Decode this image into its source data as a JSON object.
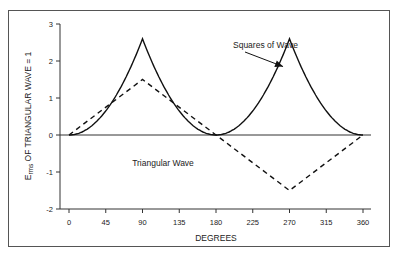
{
  "chart_data": {
    "type": "line",
    "title": "",
    "xlabel": "DEGREES",
    "ylabel_main": "E",
    "ylabel_sub": "rms",
    "ylabel_rest": " OF TRIANGULAR WAVE = 1",
    "xlim": [
      0,
      360
    ],
    "ylim": [
      -2,
      3
    ],
    "xticks": [
      0,
      45,
      90,
      135,
      180,
      225,
      270,
      315,
      360
    ],
    "yticks": [
      3,
      2,
      1,
      0,
      -1,
      -2
    ],
    "grid": false,
    "series": [
      {
        "name": "Squares of Wave",
        "style": "solid",
        "x": [
          0,
          15,
          30,
          45,
          60,
          75,
          90,
          105,
          120,
          135,
          150,
          165,
          180,
          195,
          210,
          225,
          240,
          255,
          270,
          285,
          300,
          315,
          330,
          345,
          360
        ],
        "y": [
          0,
          0.07,
          0.29,
          0.65,
          1.16,
          1.81,
          2.6,
          1.81,
          1.16,
          0.65,
          0.29,
          0.07,
          0,
          0.07,
          0.29,
          0.65,
          1.16,
          1.81,
          2.6,
          1.81,
          1.16,
          0.65,
          0.29,
          0.07,
          0
        ]
      },
      {
        "name": "Triangular Wave",
        "style": "dashed",
        "x": [
          0,
          90,
          180,
          270,
          360
        ],
        "y": [
          0,
          1.5,
          0,
          -1.5,
          0
        ]
      }
    ],
    "annotations": [
      {
        "text": "Squares of Wave",
        "arrow_to": [
          267,
          1.85
        ]
      },
      {
        "text": "Triangular Wave"
      }
    ]
  }
}
